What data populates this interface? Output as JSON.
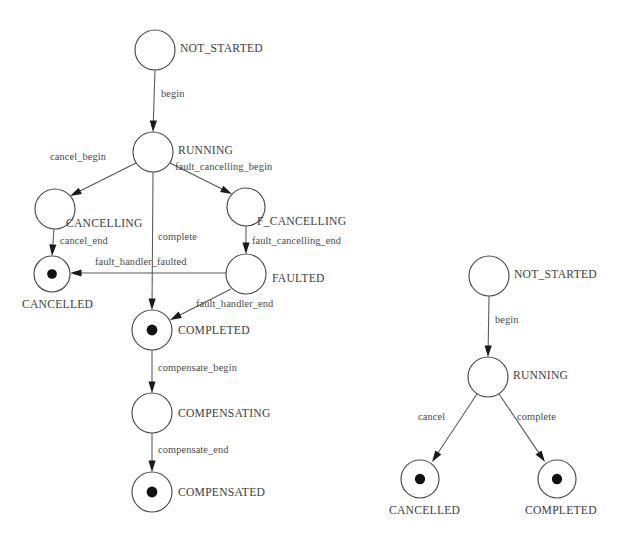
{
  "page": {
    "background_color": "#ffffff",
    "stroke_color": "#4a4a4a",
    "text_color": "#3d3d3d",
    "width": 635,
    "height": 540
  },
  "diagrams": [
    {
      "id": "scope-state-machine",
      "name": "left-diagram",
      "states": [
        {
          "id": "not_started",
          "label": "NOT_STARTED",
          "kind": "initial",
          "cx": 155,
          "cy": 50,
          "r": 20,
          "label_x": 180,
          "label_y": 49
        },
        {
          "id": "running",
          "label": "RUNNING",
          "kind": "normal",
          "cx": 153,
          "cy": 152,
          "r": 20,
          "label_x": 178,
          "label_y": 151
        },
        {
          "id": "cancelling",
          "label": "CANCELLING",
          "kind": "normal",
          "cx": 55,
          "cy": 209,
          "r": 20,
          "label_x": 66,
          "label_y": 224
        },
        {
          "id": "f_cancelling",
          "label": "F_CANCELLING",
          "kind": "normal",
          "cx": 246,
          "cy": 207,
          "r": 19,
          "label_x": 257,
          "label_y": 222
        },
        {
          "id": "cancelled",
          "label": "CANCELLED",
          "kind": "final",
          "cx": 52,
          "cy": 274,
          "r": 18,
          "label_x": 22,
          "label_y": 305
        },
        {
          "id": "faulted",
          "label": "FAULTED",
          "kind": "normal",
          "cx": 246,
          "cy": 274,
          "r": 20,
          "label_x": 272,
          "label_y": 279
        },
        {
          "id": "completed",
          "label": "COMPLETED",
          "kind": "final",
          "cx": 152,
          "cy": 330,
          "r": 20,
          "label_x": 178,
          "label_y": 331
        },
        {
          "id": "compensating",
          "label": "COMPENSATING",
          "kind": "normal",
          "cx": 152,
          "cy": 413,
          "r": 20,
          "label_x": 178,
          "label_y": 414
        },
        {
          "id": "compensated",
          "label": "COMPENSATED",
          "kind": "final",
          "cx": 152,
          "cy": 492,
          "r": 20,
          "label_x": 178,
          "label_y": 493
        }
      ],
      "transitions": [
        {
          "id": "t1",
          "label": "begin",
          "from": "not_started",
          "to": "running",
          "x1": 155,
          "y1": 70,
          "x2": 153,
          "y2": 132,
          "label_x": 161,
          "label_y": 95
        },
        {
          "id": "t2",
          "label": "cancel_begin",
          "from": "running",
          "to": "cancelling",
          "x1": 136,
          "y1": 163,
          "x2": 70,
          "y2": 196,
          "label_x": 50,
          "label_y": 158
        },
        {
          "id": "t3",
          "label": "fault_cancelling_begin",
          "from": "running",
          "to": "f_cancelling",
          "x1": 170,
          "y1": 163,
          "x2": 232,
          "y2": 194,
          "label_x": 175,
          "label_y": 168
        },
        {
          "id": "t4",
          "label": "cancel_end",
          "from": "cancelling",
          "to": "cancelled",
          "x1": 54,
          "y1": 229,
          "x2": 52,
          "y2": 256,
          "label_x": 60,
          "label_y": 242
        },
        {
          "id": "t5",
          "label": "fault_cancelling_end",
          "from": "f_cancelling",
          "to": "faulted",
          "x1": 246,
          "y1": 226,
          "x2": 246,
          "y2": 254,
          "label_x": 252,
          "label_y": 242
        },
        {
          "id": "t6",
          "label": "complete",
          "from": "running",
          "to": "completed",
          "x1": 153,
          "y1": 172,
          "x2": 152,
          "y2": 310,
          "label_x": 158,
          "label_y": 238
        },
        {
          "id": "t7",
          "label": "fault_handler_faulted",
          "from": "faulted",
          "to": "cancelled",
          "x1": 226,
          "y1": 273,
          "x2": 70,
          "y2": 273,
          "label_x": 95,
          "label_y": 263
        },
        {
          "id": "t8",
          "label": "fault_handler_end",
          "from": "faulted",
          "to": "completed",
          "x1": 231,
          "y1": 289,
          "x2": 170,
          "y2": 320,
          "label_x": 196,
          "label_y": 305
        },
        {
          "id": "t9",
          "label": "compensate_begin",
          "from": "completed",
          "to": "compensating",
          "x1": 152,
          "y1": 350,
          "x2": 152,
          "y2": 393,
          "label_x": 158,
          "label_y": 369
        },
        {
          "id": "t10",
          "label": "compensate_end",
          "from": "compensating",
          "to": "compensated",
          "x1": 152,
          "y1": 433,
          "x2": 152,
          "y2": 472,
          "label_x": 158,
          "label_y": 451
        }
      ]
    },
    {
      "id": "activity-state-machine",
      "name": "right-diagram",
      "states": [
        {
          "id": "r_not_started",
          "label": "NOT_STARTED",
          "kind": "initial",
          "cx": 489,
          "cy": 276,
          "r": 20,
          "label_x": 514,
          "label_y": 275
        },
        {
          "id": "r_running",
          "label": "RUNNING",
          "kind": "normal",
          "cx": 488,
          "cy": 377,
          "r": 20,
          "label_x": 513,
          "label_y": 376
        },
        {
          "id": "r_cancelled",
          "label": "CANCELLED",
          "kind": "final",
          "cx": 420,
          "cy": 479,
          "r": 19,
          "label_x": 389,
          "label_y": 511
        },
        {
          "id": "r_completed",
          "label": "COMPLETED",
          "kind": "final",
          "cx": 557,
          "cy": 479,
          "r": 19,
          "label_x": 525,
          "label_y": 511
        }
      ],
      "transitions": [
        {
          "id": "rt1",
          "label": "begin",
          "from": "r_not_started",
          "to": "r_running",
          "x1": 489,
          "y1": 296,
          "x2": 488,
          "y2": 357,
          "label_x": 495,
          "label_y": 321
        },
        {
          "id": "rt2",
          "label": "cancel",
          "from": "r_running",
          "to": "r_cancelled",
          "x1": 477,
          "y1": 394,
          "x2": 432,
          "y2": 462,
          "label_x": 418,
          "label_y": 418
        },
        {
          "id": "rt3",
          "label": "complete",
          "from": "r_running",
          "to": "r_completed",
          "x1": 499,
          "y1": 394,
          "x2": 545,
          "y2": 462,
          "label_x": 517,
          "label_y": 418
        }
      ]
    }
  ]
}
